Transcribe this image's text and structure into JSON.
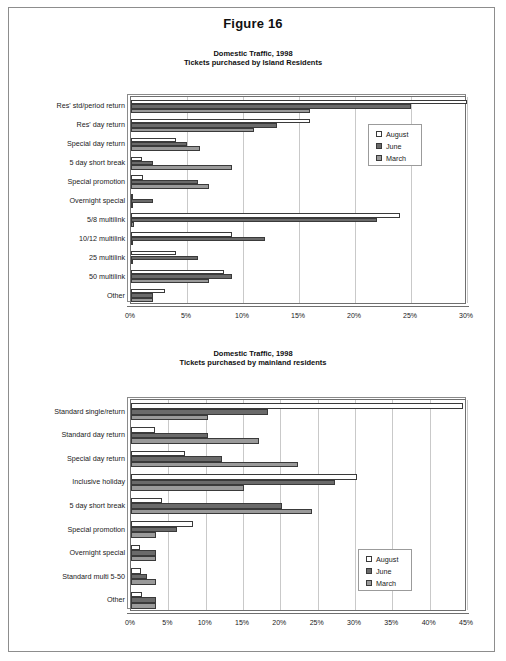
{
  "figure": {
    "title": "Figure 16"
  },
  "legend": {
    "items": [
      {
        "label": "August",
        "swatch": "august",
        "color": "#ffffff"
      },
      {
        "label": "June",
        "swatch": "june",
        "color": "#6a6a6a"
      },
      {
        "label": "March",
        "swatch": "march",
        "color": "#9a9a9a"
      }
    ]
  },
  "charts": [
    {
      "subtitle_line1": "Domestic Traffic, 1998",
      "subtitle_line2": "Tickets purchased by Island Residents",
      "legend_position": "upper-right-inside"
    },
    {
      "subtitle_line1": "Domestic Traffic, 1998",
      "subtitle_line2": "Tickets purchased by mainland residents",
      "legend_position": "lower-right-inside"
    }
  ],
  "chart_data": [
    {
      "type": "bar",
      "orientation": "horizontal",
      "title": "Domestic Traffic, 1998 - Tickets purchased by Island Residents",
      "xlabel": "",
      "ylabel": "",
      "xlim": [
        0,
        30
      ],
      "xticks": [
        0,
        5,
        10,
        15,
        20,
        25,
        30
      ],
      "xtick_labels": [
        "0%",
        "5%",
        "10%",
        "15%",
        "20%",
        "25%",
        "30%"
      ],
      "grid": true,
      "legend": [
        "August",
        "June",
        "March"
      ],
      "categories": [
        "Res' std/period return",
        "Res' day return",
        "Special day return",
        "5 day short break",
        "Special promotion",
        "Overnight special",
        "5/8 multilink",
        "10/12 multilink",
        "25 multilink",
        "50 multilink",
        "Other"
      ],
      "series": [
        {
          "name": "August",
          "values": [
            30.0,
            16.0,
            4.0,
            1.0,
            1.1,
            0.2,
            24.0,
            9.0,
            4.0,
            8.3,
            3.0
          ]
        },
        {
          "name": "June",
          "values": [
            25.0,
            13.0,
            5.0,
            2.0,
            6.0,
            2.0,
            22.0,
            12.0,
            6.0,
            9.0,
            2.0
          ]
        },
        {
          "name": "March",
          "values": [
            16.0,
            11.0,
            6.2,
            9.0,
            7.0,
            0.2,
            0.3,
            0.2,
            0.2,
            7.0,
            2.0
          ]
        }
      ]
    },
    {
      "type": "bar",
      "orientation": "horizontal",
      "title": "Domestic Traffic, 1998 - Tickets purchased by mainland residents",
      "xlabel": "",
      "ylabel": "",
      "xlim": [
        0,
        45
      ],
      "xticks": [
        0,
        5,
        10,
        15,
        20,
        25,
        30,
        35,
        40,
        45
      ],
      "xtick_labels": [
        "0%",
        "5%",
        "10%",
        "15%",
        "20%",
        "25%",
        "30%",
        "35%",
        "40%",
        "45%"
      ],
      "grid": true,
      "legend": [
        "August",
        "June",
        "March"
      ],
      "categories": [
        "Standard single/return",
        "Standard day return",
        "Special day return",
        "Inclusive holiday",
        "5 day short break",
        "Special promotion",
        "Overnight special",
        "Standard multi 5-50",
        "Other"
      ],
      "series": [
        {
          "name": "August",
          "values": [
            44.5,
            3.2,
            7.2,
            30.3,
            4.2,
            8.3,
            1.2,
            1.3,
            1.5
          ]
        },
        {
          "name": "June",
          "values": [
            18.3,
            10.3,
            12.2,
            27.3,
            20.2,
            6.2,
            3.3,
            2.2,
            3.3
          ]
        },
        {
          "name": "March",
          "values": [
            10.3,
            17.2,
            22.3,
            15.2,
            24.3,
            3.3,
            3.3,
            3.3,
            3.3
          ]
        }
      ]
    }
  ]
}
